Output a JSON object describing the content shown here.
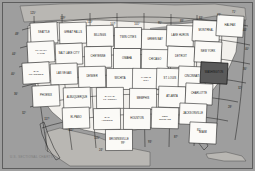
{
  "map": {
    "title": "U.S. Sectional Aeronautical Chart Index",
    "projection": "Lambert Conformal Conic",
    "background_color": "#9a9a9a",
    "land_color": "#f2f0ec",
    "cell_fill": "#fbfaf7",
    "cell_stroke": "#1f1f1f",
    "highlight_color": "#5a5a5a",
    "credit": "U.S. SECTIONAL CHARTS",
    "highlighted_chart": "WASHINGTON"
  },
  "graticule": {
    "longitude_labels": [
      {
        "text": "125°",
        "x": 33,
        "y": 14
      },
      {
        "text": "119°",
        "x": 63,
        "y": 19
      },
      {
        "text": "113°",
        "x": 90,
        "y": 23
      },
      {
        "text": "107°",
        "x": 113,
        "y": 25
      },
      {
        "text": "101°",
        "x": 137,
        "y": 25
      },
      {
        "text": "95°",
        "x": 160,
        "y": 24
      },
      {
        "text": "89°",
        "x": 182,
        "y": 22
      },
      {
        "text": "83°",
        "x": 201,
        "y": 19
      },
      {
        "text": "77°",
        "x": 219,
        "y": 16
      },
      {
        "text": "71°",
        "x": 234,
        "y": 13
      }
    ],
    "latitude_labels_left": [
      {
        "text": "48°",
        "x": 15,
        "y": 35
      },
      {
        "text": "44°",
        "x": 12,
        "y": 55
      },
      {
        "text": "40°",
        "x": 11,
        "y": 75
      },
      {
        "text": "36°",
        "x": 14,
        "y": 95
      },
      {
        "text": "32°",
        "x": 22,
        "y": 114
      }
    ],
    "latitude_labels_right": [
      {
        "text": "44°",
        "x": 243,
        "y": 31
      },
      {
        "text": "40°",
        "x": 245,
        "y": 50
      },
      {
        "text": "36°",
        "x": 243,
        "y": 70
      },
      {
        "text": "32°",
        "x": 238,
        "y": 89
      },
      {
        "text": "28°",
        "x": 228,
        "y": 108
      }
    ],
    "bottom_labels": [
      {
        "text": "117°",
        "x": 47,
        "y": 120
      },
      {
        "text": "111°",
        "x": 71,
        "y": 131
      },
      {
        "text": "105°",
        "x": 97,
        "y": 139
      },
      {
        "text": "99°",
        "x": 123,
        "y": 144
      },
      {
        "text": "93°",
        "x": 150,
        "y": 143
      },
      {
        "text": "87°",
        "x": 176,
        "y": 138
      },
      {
        "text": "81°",
        "x": 199,
        "y": 131
      },
      {
        "text": "24°",
        "x": 101,
        "y": 151
      }
    ]
  },
  "charts": [
    {
      "name": "SEATTLE",
      "x": 44,
      "y": 33,
      "lines": [
        "SEATTLE"
      ]
    },
    {
      "name": "GREAT FALLS",
      "x": 73,
      "y": 33,
      "lines": [
        "GREAT FALLS"
      ]
    },
    {
      "name": "BILLINGS",
      "x": 100,
      "y": 36,
      "lines": [
        "BILLINGS"
      ]
    },
    {
      "name": "TWIN CITIES",
      "x": 128,
      "y": 38,
      "lines": [
        "TWIN CITIES"
      ]
    },
    {
      "name": "GREEN BAY",
      "x": 155,
      "y": 40,
      "lines": [
        "GREEN BAY"
      ]
    },
    {
      "name": "LAKE HURON",
      "x": 180,
      "y": 36,
      "lines": [
        "LAKE HURON"
      ]
    },
    {
      "name": "MONTREAL",
      "x": 206,
      "y": 31,
      "lines": [
        "MONTREAL"
      ]
    },
    {
      "name": "HALIFAX",
      "x": 230,
      "y": 26,
      "lines": [
        "HALIFAX"
      ]
    },
    {
      "name": "KLAMATH FALLS",
      "x": 41,
      "y": 52,
      "lines": [
        "KLAMATH",
        "FALLS"
      ]
    },
    {
      "name": "SALT LAKE CITY",
      "x": 69,
      "y": 54,
      "lines": [
        "SALT LAKE CITY"
      ]
    },
    {
      "name": "CHEYENNE",
      "x": 98,
      "y": 57,
      "lines": [
        "CHEYENNE"
      ]
    },
    {
      "name": "OMAHA",
      "x": 127,
      "y": 59,
      "lines": [
        "OMAHA"
      ]
    },
    {
      "name": "CHICAGO",
      "x": 155,
      "y": 60,
      "lines": [
        "CHICAGO"
      ]
    },
    {
      "name": "DETROIT",
      "x": 181,
      "y": 57,
      "lines": [
        "DETROIT"
      ]
    },
    {
      "name": "NEW YORK",
      "x": 208,
      "y": 52,
      "lines": [
        "NEW YORK"
      ]
    },
    {
      "name": "SAN FRANCISCO",
      "x": 36,
      "y": 73,
      "lines": [
        "SAN",
        "FRANCISCO"
      ]
    },
    {
      "name": "LAS VEGAS",
      "x": 64,
      "y": 74,
      "lines": [
        "LAS VEGAS"
      ]
    },
    {
      "name": "DENVER",
      "x": 92,
      "y": 77,
      "lines": [
        "DENVER"
      ]
    },
    {
      "name": "WICHITA",
      "x": 120,
      "y": 79,
      "lines": [
        "WICHITA"
      ]
    },
    {
      "name": "KANSAS CITY",
      "x": 146,
      "y": 79,
      "lines": [
        "KANSAS",
        "CITY"
      ]
    },
    {
      "name": "ST LOUIS",
      "x": 170,
      "y": 79,
      "lines": [
        "ST. LOUIS"
      ]
    },
    {
      "name": "CINCINNATI",
      "x": 192,
      "y": 77,
      "lines": [
        "CINCINNATI"
      ]
    },
    {
      "name": "WASHINGTON",
      "x": 214,
      "y": 73,
      "lines": [
        "WASHINGTON"
      ],
      "highlight": true
    },
    {
      "name": "PHOENIX",
      "x": 46,
      "y": 96,
      "lines": [
        "PHOENIX"
      ]
    },
    {
      "name": "ALBUQUERQUE",
      "x": 77,
      "y": 98,
      "lines": [
        "ALBUQUERQUE"
      ]
    },
    {
      "name": "DALLAS FT WORTH",
      "x": 110,
      "y": 98,
      "lines": [
        "DALLAS-",
        "FT. WORTH"
      ]
    },
    {
      "name": "MEMPHIS",
      "x": 143,
      "y": 99,
      "lines": [
        "MEMPHIS"
      ]
    },
    {
      "name": "ATLANTA",
      "x": 172,
      "y": 97,
      "lines": [
        "ATLANTA"
      ]
    },
    {
      "name": "CHARLOTTE",
      "x": 199,
      "y": 94,
      "lines": [
        "CHARLOTTE"
      ]
    },
    {
      "name": "EL PASO",
      "x": 76,
      "y": 118,
      "lines": [
        "EL PASO"
      ]
    },
    {
      "name": "SAN ANTONIO",
      "x": 107,
      "y": 119,
      "lines": [
        "SAN",
        "ANTONIO"
      ]
    },
    {
      "name": "HOUSTON",
      "x": 137,
      "y": 119,
      "lines": [
        "HOUSTON"
      ]
    },
    {
      "name": "NEW ORLEANS",
      "x": 165,
      "y": 118,
      "lines": [
        "NEW",
        "ORLEANS"
      ]
    },
    {
      "name": "JACKSONVILLE",
      "x": 193,
      "y": 114,
      "lines": [
        "JACKSONVILLE"
      ]
    },
    {
      "name": "BROWNSVILLE",
      "x": 119,
      "y": 140,
      "lines": [
        "BROWNSVILLE"
      ]
    },
    {
      "name": "MIAMI",
      "x": 203,
      "y": 133,
      "lines": [
        "MIAMI"
      ]
    }
  ]
}
